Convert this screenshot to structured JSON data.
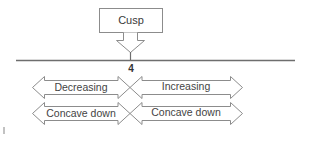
{
  "diagram": {
    "type": "sign-chart",
    "callout": {
      "label": "Cusp",
      "points_to": "4"
    },
    "number_line": {
      "tick_label": "4"
    },
    "intervals": {
      "left": {
        "direction": "left",
        "rows": [
          "Decreasing",
          "Concave down"
        ]
      },
      "right": {
        "direction": "right",
        "rows": [
          "Increasing",
          "Concave down"
        ]
      }
    },
    "colors": {
      "stroke": "#8c8c8c",
      "line": "#6e6e6e",
      "text": "#3a3a3a",
      "background": "#ffffff"
    }
  }
}
